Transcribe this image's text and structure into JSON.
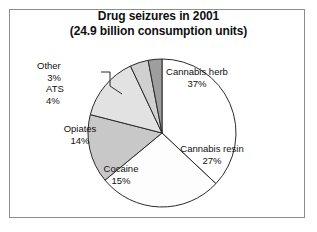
{
  "chart_data": {
    "type": "pie",
    "title": "Drug seizures in 2001 (24.9 billion consumption units)",
    "title_lines": [
      "Drug seizures in 2001",
      "(24.9 billion consumption units)"
    ],
    "total_units": "24.9 billion consumption units",
    "year": "2001",
    "unit": "%",
    "legend": "none",
    "grid": false,
    "categories": [
      "Cannabis herb",
      "Cannabis resin",
      "Cocaine",
      "Opiates",
      "ATS",
      "Other"
    ],
    "values": [
      37,
      27,
      15,
      14,
      4,
      3
    ],
    "slices": [
      {
        "name": "Cannabis herb",
        "value": 37,
        "value_label": "37%",
        "color": "#ffffff",
        "label_position": "inside"
      },
      {
        "name": "Cannabis resin",
        "value": 27,
        "value_label": "27%",
        "color": "#fdfdfd",
        "label_position": "inside"
      },
      {
        "name": "Cocaine",
        "value": 15,
        "value_label": "15%",
        "color": "#c8c8c8",
        "label_position": "inside"
      },
      {
        "name": "Opiates",
        "value": 14,
        "value_label": "14%",
        "color": "#e2e2e2",
        "label_position": "inside"
      },
      {
        "name": "ATS",
        "value": 4,
        "value_label": "4%",
        "color": "#d0d0d0",
        "label_position": "outside"
      },
      {
        "name": "Other",
        "value": 3,
        "value_label": "3%",
        "color": "#9e9e9e",
        "label_position": "outside-leader"
      }
    ],
    "colors": {
      "outline": "#2b2b2b",
      "frame": "#8c8c8c",
      "background": "#ffffff",
      "text": "#101010"
    }
  }
}
